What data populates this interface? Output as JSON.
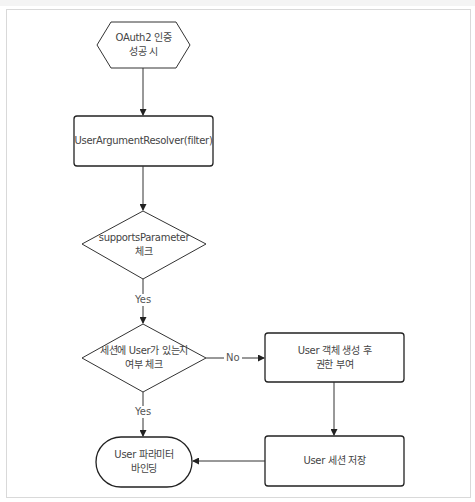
{
  "diagram": {
    "type": "flowchart",
    "stroke_color": "#222222",
    "nodes": {
      "start": {
        "shape": "hexagon",
        "label": "OAuth2 인증\n성공 시"
      },
      "resolver": {
        "shape": "rounded-rect",
        "label": "UserArgumentResolver(filter)"
      },
      "supports_check": {
        "shape": "diamond",
        "label": "supportsParameter\n체크"
      },
      "session_check": {
        "shape": "diamond",
        "label": "세션에 User가 있는지\n여부 체크"
      },
      "create_user": {
        "shape": "rounded-rect",
        "label": "User 객체 생성 후\n권한 부여"
      },
      "save_session": {
        "shape": "rounded-rect",
        "label": "User 세션 저장"
      },
      "bind_param": {
        "shape": "terminator",
        "label": "User 파라미터\n바인딩"
      }
    },
    "edges": [
      {
        "from": "start",
        "to": "resolver",
        "label": ""
      },
      {
        "from": "resolver",
        "to": "supports_check",
        "label": ""
      },
      {
        "from": "supports_check",
        "to": "session_check",
        "label": "Yes"
      },
      {
        "from": "session_check",
        "to": "create_user",
        "label": "No"
      },
      {
        "from": "session_check",
        "to": "bind_param",
        "label": "Yes"
      },
      {
        "from": "create_user",
        "to": "save_session",
        "label": ""
      },
      {
        "from": "save_session",
        "to": "bind_param",
        "label": ""
      }
    ],
    "edge_labels": {
      "supports_yes": "Yes",
      "session_no": "No",
      "session_yes": "Yes"
    }
  }
}
